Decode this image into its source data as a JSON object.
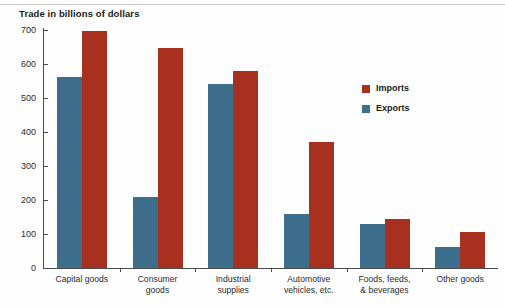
{
  "chart_data": {
    "type": "bar",
    "title": "Trade in billions of dollars",
    "xlabel": "",
    "ylabel": "",
    "ylim": [
      0,
      700
    ],
    "yticks": [
      0,
      100,
      200,
      300,
      400,
      500,
      600,
      700
    ],
    "ytick_labels": [
      "0",
      "100",
      "200",
      "300",
      "400",
      "500",
      "600",
      "700"
    ],
    "grid": false,
    "legend_position": "upper right",
    "categories": [
      "Capital goods",
      "Consumer\ngoods",
      "Industrial\nsupplies",
      "Automotive\nvehicles, etc.",
      "Foods, feeds,\n& beverages",
      "Other goods"
    ],
    "series": [
      {
        "name": "Imports",
        "color": "#a8301f",
        "values": [
          697,
          648,
          578,
          372,
          143,
          105
        ]
      },
      {
        "name": "Exports",
        "color": "#3d6e8c",
        "values": [
          562,
          210,
          540,
          158,
          128,
          62
        ]
      }
    ],
    "legend": [
      {
        "label": "Imports",
        "color": "#a8301f"
      },
      {
        "label": "Exports",
        "color": "#3d6e8c"
      }
    ]
  }
}
